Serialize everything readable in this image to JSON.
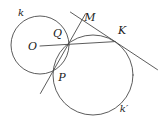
{
  "figure": {
    "labels": {
      "circle_small": "k",
      "center": "O",
      "upper_intersection": "Q",
      "external_point": "M",
      "tangent_point": "K",
      "lower_intersection": "P",
      "circle_large": "k′"
    },
    "colors": {
      "stroke": "#4a4a4a",
      "text": "#1a1a1a",
      "background": "#ffffff"
    }
  }
}
